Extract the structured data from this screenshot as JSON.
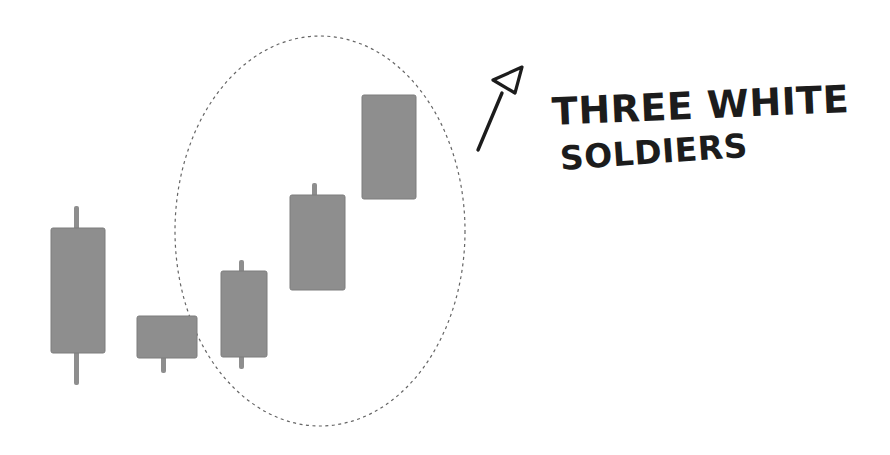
{
  "page": {
    "background_color": "#ffffff",
    "width": 890,
    "height": 455
  },
  "annotation": {
    "line1": "THREE WHITE",
    "line2": "SOLDIERS",
    "ink_color": "#1c1c1c"
  },
  "figure": {
    "type": "candlestick-pattern-diagram",
    "pattern_name": "Three White Soldiers",
    "candle_color": "#8e8e8e",
    "candle_edge_color": "#7d7d7d",
    "ellipse_color": "#4a4a4a",
    "candles": [
      {
        "name": "candle-1",
        "body": {
          "x": 51,
          "y": 228,
          "w": 54,
          "h": 125
        },
        "upper_wick": {
          "x": 74,
          "y": 206,
          "w": 5,
          "h": 24
        },
        "lower_wick": {
          "x": 74,
          "y": 351,
          "w": 5,
          "h": 34
        }
      },
      {
        "name": "candle-2",
        "body": {
          "x": 137,
          "y": 316,
          "w": 60,
          "h": 42
        },
        "lower_wick": {
          "x": 161,
          "y": 356,
          "w": 5,
          "h": 17
        }
      },
      {
        "name": "candle-3",
        "body": {
          "x": 221,
          "y": 271,
          "w": 46,
          "h": 86
        },
        "upper_wick": {
          "x": 239,
          "y": 260,
          "w": 5,
          "h": 13
        },
        "lower_wick": {
          "x": 239,
          "y": 355,
          "w": 5,
          "h": 14
        }
      },
      {
        "name": "candle-4",
        "body": {
          "x": 290,
          "y": 195,
          "w": 55,
          "h": 95
        },
        "upper_wick": {
          "x": 312,
          "y": 183,
          "w": 5,
          "h": 14
        }
      },
      {
        "name": "candle-5",
        "body": {
          "x": 362,
          "y": 95,
          "w": 54,
          "h": 104
        }
      }
    ],
    "highlight_ellipse": {
      "cx": 320,
      "cy": 231,
      "rx": 145,
      "ry": 195
    },
    "arrow": {
      "shaft": {
        "x1": 478,
        "y1": 150,
        "x2": 502,
        "y2": 93
      },
      "head_points": "522,67 493,80 515,93"
    }
  }
}
